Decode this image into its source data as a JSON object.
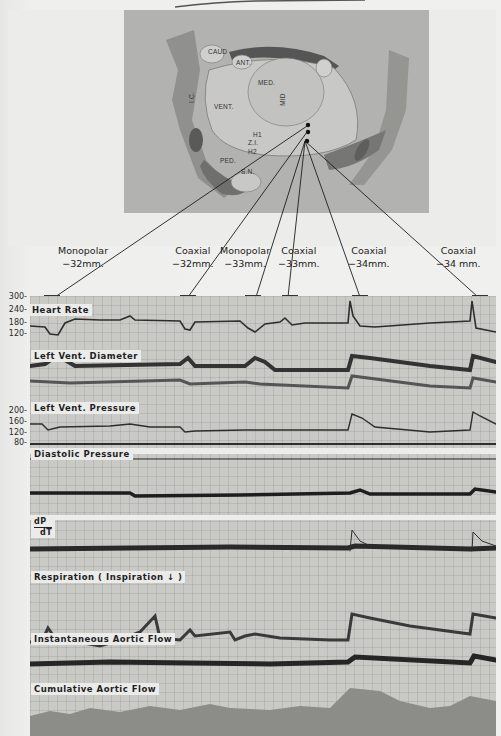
{
  "figure": {
    "type": "physiological recording with brain stimulation site diagram"
  },
  "brain_diagram": {
    "labels": [
      {
        "text": "CAUD",
        "x": 208,
        "y": 52
      },
      {
        "text": "ANT.",
        "x": 238,
        "y": 61
      },
      {
        "text": "MED.",
        "x": 260,
        "y": 81
      },
      {
        "text": "MID",
        "x": 280,
        "y": 100
      },
      {
        "text": "VENT.",
        "x": 216,
        "y": 104
      },
      {
        "text": "I.C.",
        "x": 188,
        "y": 94
      },
      {
        "text": "H1",
        "x": 254,
        "y": 133
      },
      {
        "text": "Z.I.",
        "x": 248,
        "y": 141
      },
      {
        "text": "H2",
        "x": 248,
        "y": 150
      },
      {
        "text": "PED.",
        "x": 221,
        "y": 159
      },
      {
        "text": "S.N.",
        "x": 243,
        "y": 169
      }
    ],
    "stimulation_points": 3
  },
  "electrodes": [
    {
      "type": "Monopolar",
      "depth": "−32mm.",
      "x": 82,
      "y": 270
    },
    {
      "type": "Coaxial",
      "depth": "−32mm.",
      "x": 193,
      "y": 270
    },
    {
      "type": "Monopolar",
      "depth": "−33mm.",
      "x": 242,
      "y": 270
    },
    {
      "type": "Coaxial",
      "depth": "−33mm.",
      "x": 300,
      "y": 270
    },
    {
      "type": "Coaxial",
      "depth": "−34mm.",
      "x": 368,
      "y": 270
    },
    {
      "type": "Coaxial",
      "depth": "−34 mm.",
      "x": 470,
      "y": 270
    }
  ],
  "axis_ticks": {
    "heart_rate": [
      "300-",
      "240-",
      "180-",
      "120-"
    ],
    "lv_pressure": [
      "200-",
      "160-",
      "120-",
      "80-"
    ]
  },
  "traces": [
    {
      "label": "Heart Rate"
    },
    {
      "label": "Left Vent. Diameter"
    },
    {
      "label": "Left Vent. Pressure"
    },
    {
      "label": "Diastolic Pressure"
    },
    {
      "label_top": "dP",
      "label_bottom": "dT"
    },
    {
      "label": "Respiration ( Inspiration ↓ )"
    },
    {
      "label": "Instantaneous Aortic Flow"
    },
    {
      "label": "Cumulative Aortic Flow"
    }
  ],
  "colors": {
    "paper": "#eeeeec",
    "chart_bg": "#c9c9c6",
    "trace": "#2a2a2a",
    "diagram_bg": "#b2b2b0",
    "diagram_dark": "#8a8a88"
  }
}
